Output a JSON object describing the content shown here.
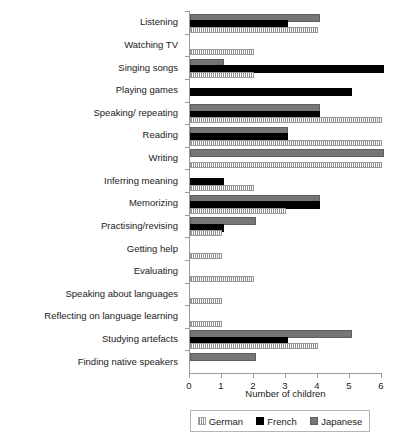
{
  "chart_data": {
    "type": "bar",
    "orientation": "horizontal",
    "title": "",
    "xlabel": "Number of children",
    "ylabel": "",
    "xlim": [
      0,
      6
    ],
    "xticks": [
      0,
      1,
      2,
      3,
      4,
      5,
      6
    ],
    "xticklabels": [
      "0",
      "1",
      "2",
      "3",
      "4",
      "5",
      "6"
    ],
    "grid": false,
    "legend_position": "bottom",
    "categories": [
      "Listening",
      "Watching TV",
      "Singing songs",
      "Playing games",
      "Speaking/ repeating",
      "Reading",
      "Writing",
      "Inferring meaning",
      "Memorizing",
      "Practising/revising",
      "Getting help",
      "Evaluating",
      "Speaking about languages",
      "Reflecting on language learning",
      "Studying artefacts",
      "Finding native speakers"
    ],
    "series": [
      {
        "name": "German",
        "color": "#8e8e8e",
        "pattern": "hatched",
        "values": [
          4,
          2,
          2,
          0,
          6,
          6,
          6,
          2,
          3,
          1,
          1,
          2,
          1,
          1,
          4,
          0
        ]
      },
      {
        "name": "French",
        "color": "#000000",
        "pattern": "solid",
        "values": [
          3,
          0,
          6,
          5,
          4,
          3,
          0,
          1,
          4,
          1,
          0,
          0,
          0,
          0,
          3,
          0
        ]
      },
      {
        "name": "Japanese",
        "color": "#767676",
        "pattern": "solid",
        "values": [
          4,
          0,
          1,
          0,
          4,
          3,
          6,
          0,
          4,
          2,
          0,
          0,
          0,
          0,
          5,
          2
        ]
      }
    ]
  },
  "legend": {
    "items": [
      {
        "label": "German",
        "swatch": "german-swatch"
      },
      {
        "label": "French",
        "swatch": "french-swatch"
      },
      {
        "label": "Japanese",
        "swatch": "japanese-swatch"
      }
    ]
  }
}
